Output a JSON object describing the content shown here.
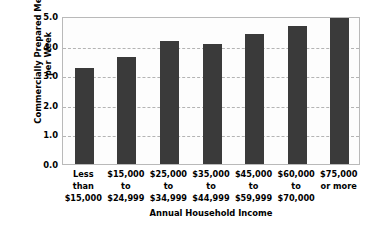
{
  "chart_data": {
    "type": "bar",
    "title": "",
    "xlabel": "Annual Household Income",
    "ylabel": "Commercially Prepared Meals\nper Week",
    "categories": [
      "Less\nthan\n$15,000",
      "$15,000\nto\n$24,999",
      "$25,000\nto\n$34,999",
      "$35,000\nto\n$44,999",
      "$45,000\nto\n$59,999",
      "$60,000\nto\n$70,000",
      "$75,000\nor more"
    ],
    "values": [
      3.25,
      3.6,
      4.15,
      4.05,
      4.4,
      4.65,
      4.95
    ],
    "ylim": [
      0.0,
      5.0
    ],
    "yticks": [
      "0.0",
      "1.0",
      "2.0",
      "3.0",
      "4.0",
      "5.0"
    ],
    "ytick_values": [
      0.0,
      1.0,
      2.0,
      3.0,
      4.0,
      5.0
    ],
    "grid": true,
    "legend": "none",
    "bar_color": "#3a3a3a",
    "gridline_color": "#b4b4b4",
    "frame_color": "#b9b9b9",
    "background_color": "#ffffff"
  }
}
